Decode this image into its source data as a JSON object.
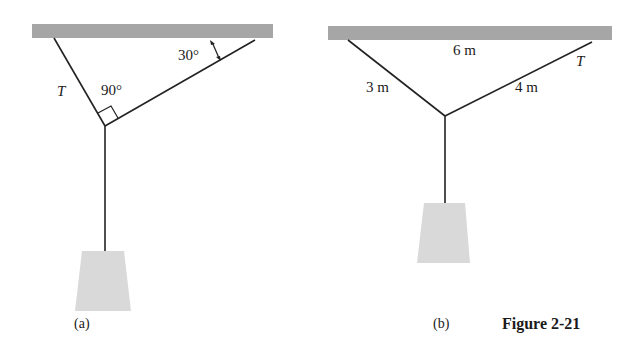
{
  "figure": {
    "caption": "Figure 2-21",
    "colors": {
      "ceiling": "#a6a6a6",
      "weight": "#d9d9d9",
      "rope": "#222222"
    },
    "panels": [
      {
        "id": "a",
        "label": "(a)",
        "labels": {
          "tension": "T",
          "right_angle": "90°",
          "ceiling_angle": "30°"
        }
      },
      {
        "id": "b",
        "label": "(b)",
        "labels": {
          "span": "6 m",
          "left_length": "3 m",
          "right_length": "4 m",
          "tension": "T"
        }
      }
    ]
  }
}
